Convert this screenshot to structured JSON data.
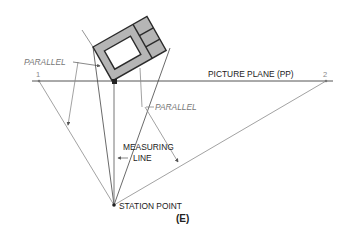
{
  "figure": {
    "label": "(E)",
    "colors": {
      "object_fill": "#b5b5b5",
      "object_stroke": "#2b2b2b",
      "line_dark": "#444444",
      "line_light": "#8a8a8a",
      "label_gray": "#777777",
      "text": "#222222"
    },
    "labels": {
      "parallel_left": "PARALLEL",
      "parallel_right": "PARALLEL",
      "picture_plane": "PICTURE PLANE (PP)",
      "measuring_line_1": "MEASURING",
      "measuring_line_2": "LINE",
      "station_point": "STATION POINT",
      "vp1": "1",
      "vp2": "2"
    }
  }
}
